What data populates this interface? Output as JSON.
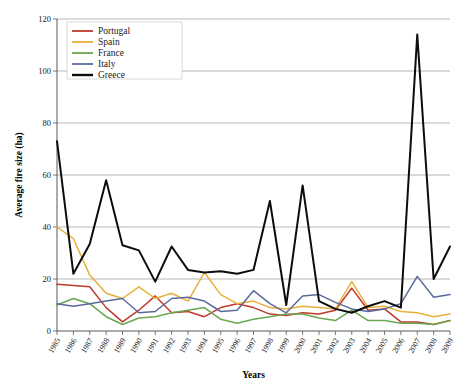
{
  "chart_data": {
    "type": "line",
    "title": "",
    "xlabel": "Years",
    "ylabel": "Average fire size (ha)",
    "ylim": [
      0,
      120
    ],
    "yticks": [
      0,
      20,
      40,
      60,
      80,
      100,
      120
    ],
    "grid": true,
    "legend_position": "top-left",
    "categories": [
      "1985",
      "1986",
      "1987",
      "1988",
      "1989",
      "1990",
      "1991",
      "1992",
      "1993",
      "1994",
      "1995",
      "1996",
      "1997",
      "1998",
      "1999",
      "2000",
      "2001",
      "2002",
      "2003",
      "2004",
      "2005",
      "2006",
      "2007",
      "2008",
      "2009"
    ],
    "series": [
      {
        "name": "Portugal",
        "color": "#c0392b",
        "values": [
          18.0,
          17.5,
          17.0,
          9.0,
          3.5,
          8.0,
          13.5,
          7.0,
          7.5,
          5.5,
          9.0,
          10.5,
          9.0,
          6.5,
          6.0,
          7.0,
          6.5,
          8.0,
          16.5,
          8.0,
          8.5,
          3.5,
          3.5,
          2.5,
          4.0
        ]
      },
      {
        "name": "Spain",
        "color": "#e8b03a",
        "values": [
          40.0,
          35.5,
          21.5,
          14.5,
          12.5,
          17.0,
          12.5,
          14.5,
          11.5,
          22.5,
          14.0,
          10.5,
          11.5,
          9.0,
          8.5,
          9.5,
          9.0,
          8.5,
          19.0,
          9.0,
          9.5,
          7.5,
          7.0,
          5.5,
          6.5
        ]
      },
      {
        "name": "France",
        "color": "#6aa84f",
        "values": [
          10.0,
          12.5,
          10.5,
          5.5,
          2.5,
          5.0,
          5.5,
          7.0,
          8.0,
          9.0,
          4.5,
          3.0,
          4.5,
          5.5,
          6.5,
          6.5,
          5.0,
          4.0,
          8.0,
          4.0,
          4.0,
          3.0,
          3.0,
          2.5,
          4.0
        ]
      },
      {
        "name": "Italy",
        "color": "#5b6a9e",
        "values": [
          10.5,
          9.5,
          10.5,
          11.5,
          12.5,
          7.0,
          7.5,
          12.5,
          13.0,
          11.5,
          7.5,
          8.0,
          15.5,
          10.5,
          7.0,
          13.5,
          14.0,
          11.0,
          8.5,
          7.5,
          8.5,
          10.5,
          21.0,
          13.0,
          14.0
        ]
      },
      {
        "name": "Greece",
        "color": "#0d0d0d",
        "values": [
          73.0,
          22.0,
          33.5,
          58.0,
          33.0,
          31.0,
          19.0,
          32.5,
          23.5,
          22.5,
          23.0,
          22.0,
          23.5,
          50.0,
          10.0,
          56.0,
          11.5,
          8.5,
          7.0,
          9.5,
          11.5,
          9.0,
          114.0,
          20.0,
          32.5
        ]
      }
    ]
  },
  "legend": {
    "items": [
      {
        "label": "Portugal"
      },
      {
        "label": "Spain"
      },
      {
        "label": "France"
      },
      {
        "label": "Italy"
      },
      {
        "label": "Greece"
      }
    ]
  }
}
